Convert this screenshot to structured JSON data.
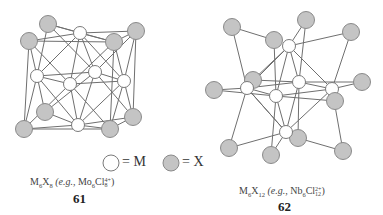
{
  "legend": {
    "m_label": "= M",
    "x_label": "= X",
    "m_color": "#ffffff",
    "x_color": "#c4c4c4"
  },
  "structures": [
    {
      "number": "61",
      "formula_main": "M",
      "formula_sub1": "6",
      "formula_x": "X",
      "formula_sub2": "8",
      "example_prefix": " (e.g., ",
      "example_metal": "Mo",
      "example_sub1": "6",
      "example_halide": "Cl",
      "example_sup": "4+",
      "example_sub2": "8",
      "example_suffix": ")"
    },
    {
      "number": "62",
      "formula_main": "M",
      "formula_sub1": "6",
      "formula_x": "X",
      "formula_sub2": "12",
      "example_prefix": " (e.g., ",
      "example_metal": "Nb",
      "example_sub1": "6",
      "example_halide": "Cl",
      "example_sup": "2+",
      "example_sub2": "12",
      "example_suffix": ")"
    }
  ]
}
